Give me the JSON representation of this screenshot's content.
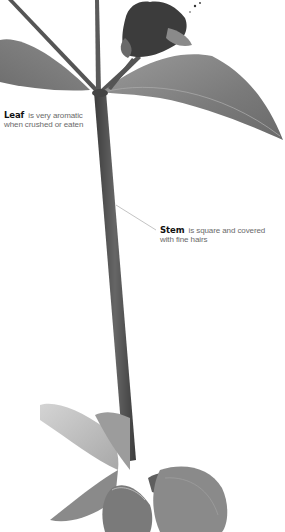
{
  "figure": {
    "style": "grayscale",
    "colors": {
      "background": "#ffffff",
      "stem": "#4a4a4a",
      "leaf": "#7d7d7d",
      "leaf_light": "#b5b5b5",
      "flower": "#3a3a3a",
      "leader_line": "#9a9a9a",
      "label_term": "#111111",
      "label_text": "#6a6a6a"
    }
  },
  "annotations": {
    "leaf": {
      "term": "Leaf",
      "description_line1": "is very aromatic",
      "description_line2": "when crushed or eaten"
    },
    "stem": {
      "term": "Stem",
      "description_line1": "is square and covered",
      "description_line2": "with fine hairs"
    }
  }
}
